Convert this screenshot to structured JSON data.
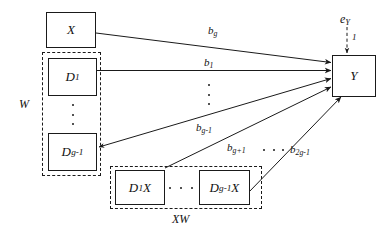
{
  "diagram": {
    "type": "path-diagram",
    "nodes": {
      "x": {
        "label": "X"
      },
      "d1": {
        "label": "D",
        "sub": "1"
      },
      "dg1": {
        "label": "D",
        "sub": "g-1"
      },
      "d1x": {
        "label": "D",
        "sub": "1",
        "suffix": "X"
      },
      "dg1x": {
        "label": "D",
        "sub": "g-1",
        "suffix": "X"
      },
      "y": {
        "label": "Y"
      }
    },
    "groups": {
      "w": {
        "label": "W"
      },
      "xw": {
        "label": "XW"
      }
    },
    "error": {
      "label": "e",
      "sub": "Y",
      "loading": "1"
    },
    "paths": [
      {
        "name": "x-to-y",
        "label": "b",
        "sub": "g"
      },
      {
        "name": "d1-to-y",
        "label": "b",
        "sub": "1"
      },
      {
        "name": "dg1-to-y",
        "label": "b",
        "sub": "g-1"
      },
      {
        "name": "d1x-to-y",
        "label": "b",
        "sub": "g+1"
      },
      {
        "name": "dg1x-to-y",
        "label": "b",
        "sub": "2g-1"
      }
    ],
    "colors": {
      "stroke": "#1a1a1a",
      "background": "#ffffff",
      "text": "#111111"
    }
  }
}
